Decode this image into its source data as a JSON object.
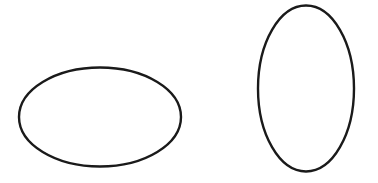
{
  "canvas": {
    "width": 378,
    "height": 183,
    "background": "#ffffff"
  },
  "stroke": {
    "color": "#1a1a1a",
    "width": 2.4
  },
  "shapes": [
    {
      "name": "horizontal-ellipse",
      "cx": 100,
      "cy": 117,
      "rx": 81,
      "ry": 49.5
    },
    {
      "name": "vertical-ellipse",
      "cx": 306,
      "cy": 88.5,
      "rx": 48,
      "ry": 83
    }
  ]
}
